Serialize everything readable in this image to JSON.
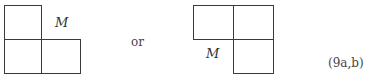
{
  "figure_a": {
    "label": "M"
  },
  "connector": "or",
  "figure_b": {
    "label": "M"
  },
  "equation_number": "(9a,b)"
}
